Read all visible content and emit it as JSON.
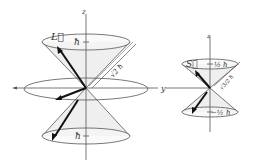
{
  "diagram": {
    "orbital": {
      "axis_z_label": "z",
      "axis_y_label": "y",
      "vector_label": "L⃗",
      "upper_projection_label": "ħ",
      "lower_projection_label": "ħ",
      "magnitude_label": "√2 ħ"
    },
    "spin": {
      "axis_z_label": "z",
      "vector_label": "S⃗",
      "upper_projection_label": "½ ħ",
      "lower_projection_label": "−½ ħ",
      "magnitude_label": "√3/2 ħ"
    },
    "colors": {
      "line": "#444444",
      "vector": "#111111",
      "cone_fill": "#ececec"
    }
  }
}
